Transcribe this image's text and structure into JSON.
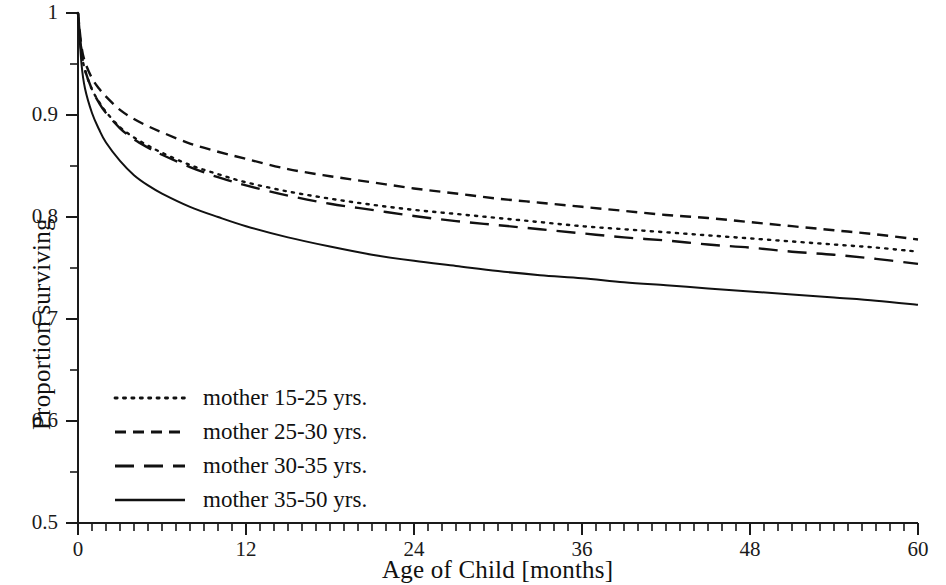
{
  "chart_data": {
    "type": "line",
    "title": "",
    "xlabel": "Age of Child [months]",
    "ylabel": "Proportion surviving",
    "xlim": [
      0,
      60
    ],
    "ylim": [
      0.5,
      1.0
    ],
    "grid": false,
    "legend_position": "lower-left inside axes",
    "x_major_ticks": [
      0,
      12,
      24,
      36,
      48,
      60
    ],
    "x_tick_labels": [
      "0",
      "12",
      "24",
      "36",
      "48",
      "60"
    ],
    "x_minor_tick_step": 1,
    "y_major_ticks": [
      0.5,
      0.6,
      0.7,
      0.8,
      0.9,
      1.0
    ],
    "y_tick_labels": [
      "0.5",
      "0.6",
      "0.7",
      "0.8",
      "0.9",
      "1"
    ],
    "y_minor_ticks": [
      0.55,
      0.65,
      0.75,
      0.85,
      0.95
    ],
    "x": [
      0,
      0.25,
      0.5,
      1,
      1.5,
      2,
      3,
      4,
      5,
      6,
      8,
      10,
      12,
      15,
      18,
      21,
      24,
      27,
      30,
      33,
      36,
      39,
      42,
      45,
      48,
      51,
      54,
      57,
      60
    ],
    "series": [
      {
        "name": "mother 15-25 yrs.",
        "style": "dotted",
        "color": "#111111",
        "values": [
          1.0,
          0.962,
          0.944,
          0.925,
          0.913,
          0.903,
          0.888,
          0.878,
          0.87,
          0.863,
          0.851,
          0.842,
          0.834,
          0.825,
          0.818,
          0.812,
          0.807,
          0.803,
          0.799,
          0.795,
          0.791,
          0.788,
          0.785,
          0.782,
          0.779,
          0.776,
          0.773,
          0.77,
          0.766
        ]
      },
      {
        "name": "mother 25-30 yrs.",
        "style": "dashed-short",
        "color": "#111111",
        "values": [
          1.0,
          0.967,
          0.952,
          0.936,
          0.926,
          0.918,
          0.905,
          0.896,
          0.889,
          0.883,
          0.872,
          0.864,
          0.857,
          0.847,
          0.84,
          0.834,
          0.828,
          0.823,
          0.818,
          0.814,
          0.81,
          0.806,
          0.802,
          0.799,
          0.795,
          0.791,
          0.787,
          0.783,
          0.778
        ]
      },
      {
        "name": "mother 30-35 yrs.",
        "style": "dashed-long",
        "color": "#111111",
        "values": [
          1.0,
          0.962,
          0.944,
          0.925,
          0.912,
          0.902,
          0.887,
          0.876,
          0.868,
          0.861,
          0.849,
          0.839,
          0.831,
          0.821,
          0.813,
          0.807,
          0.801,
          0.796,
          0.792,
          0.788,
          0.784,
          0.78,
          0.777,
          0.773,
          0.77,
          0.766,
          0.763,
          0.759,
          0.754
        ]
      },
      {
        "name": "mother 35-50 yrs.",
        "style": "solid",
        "color": "#111111",
        "values": [
          1.0,
          0.95,
          0.926,
          0.902,
          0.886,
          0.873,
          0.855,
          0.841,
          0.831,
          0.823,
          0.81,
          0.8,
          0.791,
          0.78,
          0.771,
          0.763,
          0.757,
          0.752,
          0.747,
          0.743,
          0.74,
          0.736,
          0.733,
          0.73,
          0.727,
          0.724,
          0.721,
          0.718,
          0.714
        ]
      }
    ]
  },
  "axes": {
    "ylabel": "Proportion surviving",
    "xlabel": "Age of Child [months]"
  },
  "legend": {
    "items": [
      {
        "label": "mother 15-25 yrs.",
        "style": "dotted"
      },
      {
        "label": "mother 25-30 yrs.",
        "style": "dashed-short"
      },
      {
        "label": "mother 30-35 yrs.",
        "style": "dashed-long"
      },
      {
        "label": "mother 35-50 yrs.",
        "style": "solid"
      }
    ]
  }
}
